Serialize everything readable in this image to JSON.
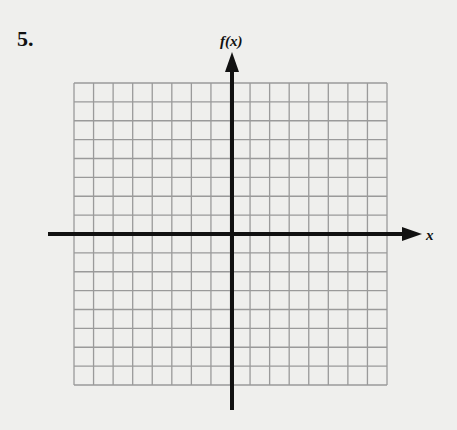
{
  "problem": {
    "number": "5."
  },
  "chart_data": {
    "type": "grid",
    "title": "",
    "xlabel": "x",
    "ylabel": "f(x)",
    "grid": {
      "columns": 16,
      "rows": 16,
      "on": true
    },
    "x_range_cells": [
      -8,
      8
    ],
    "y_range_cells": [
      -8,
      8
    ],
    "series": [],
    "tick_labels": []
  },
  "axes": {
    "x_label": "x",
    "y_label": "f(x)"
  },
  "colors": {
    "grid": "#9a9a9a",
    "axis": "#111111",
    "background": "#efefed"
  }
}
